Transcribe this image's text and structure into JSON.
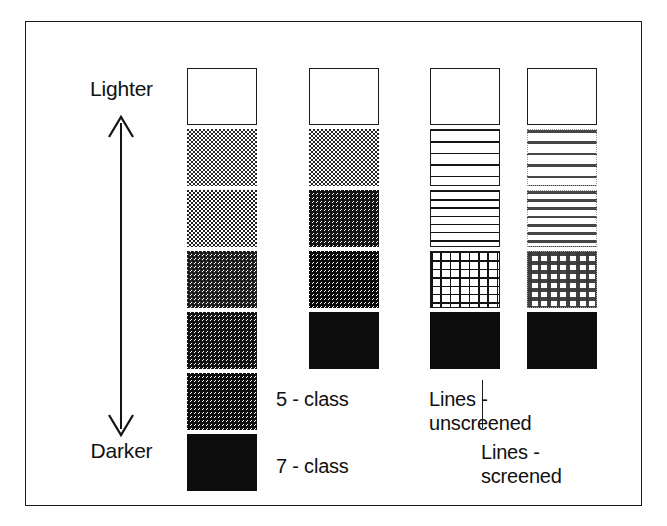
{
  "figure": {
    "type": "graphic-legend-diagram",
    "border_color": "#1a1a1a",
    "ink_color": "#111111",
    "background_color": "#ffffff"
  },
  "axis": {
    "top_label": "Lighter",
    "bottom_label": "Darker",
    "direction": "vertical double-headed arrow",
    "icon": "double-arrow-vertical-icon"
  },
  "columns": [
    {
      "id": "7-class",
      "caption": "7 - class",
      "caption_lines": [
        "7 - class"
      ],
      "class_count": 7,
      "swatch_type": "halftone-dither",
      "swatches": [
        {
          "index": 1,
          "fill": "white",
          "approx_gray_percent": 0,
          "bordered": true
        },
        {
          "index": 2,
          "fill": "dither-light",
          "approx_gray_percent": 17,
          "bordered": false
        },
        {
          "index": 3,
          "fill": "dither-2",
          "approx_gray_percent": 33,
          "bordered": false
        },
        {
          "index": 4,
          "fill": "dither-3",
          "approx_gray_percent": 50,
          "bordered": false
        },
        {
          "index": 5,
          "fill": "dither-4",
          "approx_gray_percent": 67,
          "bordered": false
        },
        {
          "index": 6,
          "fill": "dither-5",
          "approx_gray_percent": 83,
          "bordered": false
        },
        {
          "index": 7,
          "fill": "solid-black",
          "approx_gray_percent": 100,
          "bordered": false
        }
      ]
    },
    {
      "id": "5-class",
      "caption": "5 - class",
      "caption_lines": [
        "5 - class"
      ],
      "class_count": 5,
      "swatch_type": "halftone-dither",
      "swatches": [
        {
          "index": 1,
          "fill": "white",
          "approx_gray_percent": 0,
          "bordered": true
        },
        {
          "index": 2,
          "fill": "dither-light",
          "approx_gray_percent": 25,
          "bordered": false
        },
        {
          "index": 3,
          "fill": "dither-mid",
          "approx_gray_percent": 50,
          "bordered": false
        },
        {
          "index": 4,
          "fill": "dither-dark",
          "approx_gray_percent": 75,
          "bordered": false
        },
        {
          "index": 5,
          "fill": "solid-black",
          "approx_gray_percent": 100,
          "bordered": false
        }
      ]
    },
    {
      "id": "lines-unscreened",
      "caption": "Lines -\nunscreened",
      "caption_lines": [
        "Lines -",
        "unscreened"
      ],
      "class_count": 5,
      "swatch_type": "line-pattern-unscreened",
      "swatches": [
        {
          "index": 1,
          "fill": "white",
          "pattern": "none",
          "bordered": true
        },
        {
          "index": 2,
          "fill": "lines-coarse",
          "pattern": "horizontal-lines",
          "line_count": 4,
          "bordered": true
        },
        {
          "index": 3,
          "fill": "lines-fine",
          "pattern": "horizontal-lines",
          "line_count": 6,
          "bordered": true
        },
        {
          "index": 4,
          "fill": "crosshatch",
          "pattern": "cross-hatch-grid",
          "columns": 7,
          "rows": 6,
          "bordered": true
        },
        {
          "index": 5,
          "fill": "solid-black",
          "pattern": "solid",
          "bordered": false
        }
      ]
    },
    {
      "id": "lines-screened",
      "caption": "Lines -\nscreened",
      "caption_lines": [
        "Lines -",
        "screened"
      ],
      "class_count": 5,
      "swatch_type": "line-pattern-screened",
      "swatches": [
        {
          "index": 1,
          "fill": "white",
          "pattern": "none",
          "bordered": true
        },
        {
          "index": 2,
          "fill": "screened-coarse",
          "pattern": "horizontal-lines-screened",
          "line_count": 4,
          "bordered": false
        },
        {
          "index": 3,
          "fill": "screened-fine",
          "pattern": "horizontal-lines-screened",
          "line_count": 6,
          "bordered": false
        },
        {
          "index": 4,
          "fill": "screened-crosshatch",
          "pattern": "cross-hatch-grid-screened",
          "columns": 7,
          "rows": 6,
          "bordered": false
        },
        {
          "index": 5,
          "fill": "solid-black",
          "pattern": "solid",
          "bordered": false
        }
      ]
    }
  ],
  "annotations": {
    "leader_line": "vertical leader line connecting 'Lines - screened' caption to its column"
  }
}
